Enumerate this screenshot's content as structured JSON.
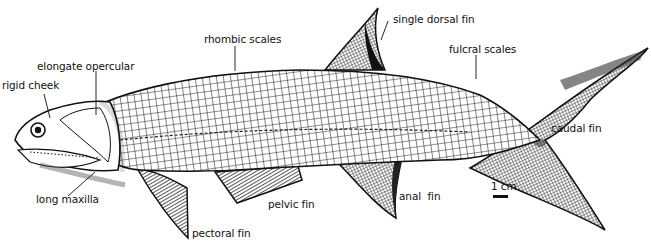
{
  "figure": {
    "labels": {
      "rigid_cheek": "rigid cheek",
      "elongate_opercular": "elongate opercular",
      "rhombic_scales": "rhombic scales",
      "single_dorsal_fin": "single dorsal fin",
      "fulcral_scales": "fulcral scales",
      "caudal_fin": "caudal fin",
      "long_maxilla": "long maxilla",
      "pectoral_fin": "pectoral fin",
      "pelvic_fin": "pelvic fin",
      "anal_fin": "anal  fin",
      "scale_bar": "1 cm"
    }
  }
}
